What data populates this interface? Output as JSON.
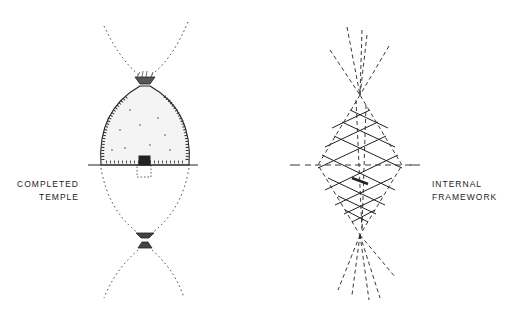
{
  "figure": {
    "left_diagram": {
      "name": "completed-temple",
      "label_lines": [
        "COMPLETED",
        "TEMPLE"
      ]
    },
    "right_diagram": {
      "name": "internal-framework",
      "label_lines": [
        "INTERNAL",
        "FRAMEWORK"
      ]
    },
    "colors": {
      "ink": "#222222",
      "background": "#ffffff"
    }
  }
}
